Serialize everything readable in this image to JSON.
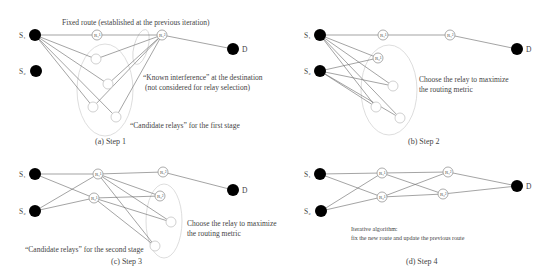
{
  "colors": {
    "node_fill": "#000000",
    "edge": "#666666",
    "relay_stroke": "#888888",
    "ellipse": "#d4d4d4",
    "gray_text": "#999999"
  },
  "panels": [
    {
      "id": "a",
      "caption": "(a) Step 1",
      "annotations": {
        "fixed_route": "Fixed route (established at the previous iteration)",
        "known_interference": "“Known interference” at the destination",
        "not_considered": "(not considered for relay selection)",
        "candidates": "“Candidate relays” for the first stage"
      },
      "nodes": {
        "s1": "S₁",
        "s2": "S₂",
        "d": "D",
        "r1": "R₁¹",
        "r2": "R₁²"
      }
    },
    {
      "id": "b",
      "caption": "(b) Step 2",
      "annotations": {
        "choose_1": "Choose the relay to maximize",
        "choose_2": "the routing metric"
      },
      "nodes": {
        "s1": "S₁",
        "s2": "S₂",
        "d": "D",
        "r11": "R₁¹",
        "r21": "R₁²",
        "r12": "R₂¹"
      }
    },
    {
      "id": "c",
      "caption": "(c) Step 3",
      "annotations": {
        "choose_1": "Choose the relay to maximize",
        "choose_2": "the routing metric",
        "candidates": "“Candidate relays” for the second stage"
      },
      "nodes": {
        "s1": "S₁",
        "s2": "S₂",
        "d": "D",
        "r11": "R₁¹",
        "r12": "R₂¹",
        "r21": "R₁²",
        "r22": "R₂²"
      }
    },
    {
      "id": "d",
      "caption": "(d) Step 4",
      "annotations": {
        "iter_1": "Iterative algorithm:",
        "iter_2": "fix the new route and update the previous route"
      },
      "nodes": {
        "s1": "S₁",
        "s2": "S₂",
        "d": "D",
        "r11": "R₁¹",
        "r12": "R₂¹",
        "r21": "R₁²",
        "r22": "R₂²"
      }
    }
  ]
}
